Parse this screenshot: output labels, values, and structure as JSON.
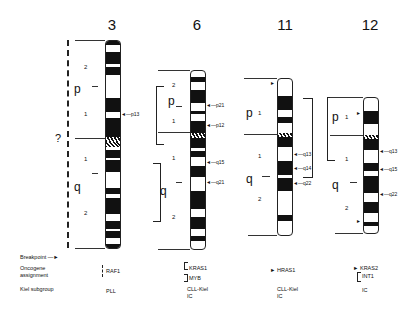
{
  "figure": {
    "type": "chromosome-ideogram-panel",
    "chromosomes": [
      {
        "id": "3",
        "title": "3",
        "arms": {
          "p": "p",
          "q": "q"
        },
        "region_labels": [
          {
            "text": "2",
            "arm": "p"
          },
          {
            "text": "1",
            "arm": "p"
          },
          {
            "text": "1",
            "arm": "q"
          },
          {
            "text": "2",
            "arm": "q"
          }
        ],
        "uncertain_label": "?",
        "bracket_style": "dashed",
        "breakpoints": [
          {
            "band": "p13",
            "label": "p13"
          }
        ],
        "oncogene": "RAF1",
        "kiel_subgroup": "PLL",
        "band_labels_p": [
          "26",
          "25",
          "24",
          "23",
          "22",
          "21",
          "14",
          "13",
          "12",
          "11"
        ],
        "band_labels_q": [
          "11.1",
          "11.2",
          "12",
          "13.1",
          "13.2",
          "13.3",
          "21",
          "22",
          "23",
          "24",
          "25",
          "26.1",
          "26.2",
          "26.3",
          "27",
          "28",
          "29"
        ]
      },
      {
        "id": "6",
        "title": "6",
        "arms": {
          "p": "p",
          "q": "q"
        },
        "region_labels": [
          {
            "text": "2",
            "arm": "p"
          },
          {
            "text": "1",
            "arm": "p"
          },
          {
            "text": "1",
            "arm": "q"
          },
          {
            "text": "2",
            "arm": "q"
          }
        ],
        "bracket_style": "solid",
        "breakpoints": [
          {
            "band": "p21",
            "label": "p21"
          },
          {
            "band": "p12",
            "label": "p12"
          },
          {
            "band": "q15",
            "label": "q15"
          },
          {
            "band": "q21",
            "label": "q21"
          }
        ],
        "oncogene_lines": [
          "KRAS1",
          "MYB"
        ],
        "kiel_subgroup": [
          "CLL-Kiel",
          "IC"
        ],
        "band_labels_p": [
          "25",
          "24",
          "23",
          "22",
          "21.3",
          "21.2",
          "21.1",
          "12",
          "11"
        ],
        "band_labels_q": [
          "11",
          "12",
          "13",
          "14",
          "15",
          "16",
          "21",
          "22",
          "23",
          "24",
          "25",
          "26",
          "27"
        ]
      },
      {
        "id": "11",
        "title": "11",
        "arms": {
          "p": "p",
          "q": "q"
        },
        "region_labels": [
          {
            "text": "1",
            "arm": "p"
          },
          {
            "text": "1",
            "arm": "q"
          },
          {
            "text": "2",
            "arm": "q"
          }
        ],
        "bracket_style": "solid",
        "breakpoints": [
          {
            "band": "p15",
            "label": ""
          },
          {
            "band": "q13",
            "label": "q13"
          },
          {
            "band": "q14",
            "label": "q14"
          },
          {
            "band": "q22",
            "label": "q22"
          }
        ],
        "oncogene_lines": [
          "HRAS1"
        ],
        "kiel_subgroup": [
          "CLL-Kiel",
          "IC"
        ],
        "band_labels_p": [
          "15",
          "14",
          "13",
          "12",
          "11.2",
          "11.1"
        ],
        "band_labels_q": [
          "11",
          "12",
          "13",
          "14",
          "21",
          "22",
          "23",
          "24",
          "25"
        ]
      },
      {
        "id": "12",
        "title": "12",
        "arms": {
          "p": "p",
          "q": "q"
        },
        "region_labels": [
          {
            "text": "1",
            "arm": "p"
          },
          {
            "text": "1",
            "arm": "q"
          },
          {
            "text": "2",
            "arm": "q"
          }
        ],
        "bracket_style": "solid",
        "breakpoints": [
          {
            "band": "p12",
            "label": ""
          },
          {
            "band": "q13",
            "label": "q13"
          },
          {
            "band": "q15",
            "label": "q15"
          },
          {
            "band": "q22",
            "label": "q22"
          },
          {
            "band": "q24.2",
            "label": ""
          }
        ],
        "oncogene_lines": [
          "KRAS2",
          "INT1"
        ],
        "kiel_subgroup": [
          "IC"
        ],
        "band_labels_p": [
          "13",
          "12",
          "11.2",
          "11.1"
        ],
        "band_labels_q": [
          "11",
          "12",
          "13",
          "14",
          "15",
          "21",
          "22",
          "23",
          "24.1",
          "24.2",
          "24.3"
        ]
      }
    ],
    "legend": {
      "breakpoint": "Breakpoint",
      "oncogene": [
        "Oncogene",
        "assignment"
      ],
      "kiel": "Kiel subgroup"
    },
    "colors": {
      "ink": "#111111",
      "paper": "#ffffff"
    }
  }
}
